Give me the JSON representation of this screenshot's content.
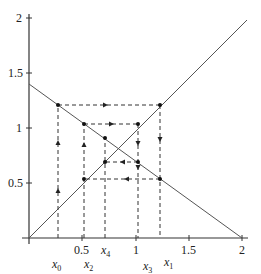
{
  "diagram": {
    "type": "cobweb-plot",
    "axes": {
      "x_ticks": [
        "0.5",
        "1",
        "1.5",
        "2"
      ],
      "y_ticks": [
        "0.5",
        "1",
        "1.5",
        "2"
      ],
      "x_range": [
        0,
        2
      ],
      "y_range": [
        0,
        2
      ]
    },
    "curves": [
      {
        "name": "identity-line",
        "equation": "y = x"
      },
      {
        "name": "decreasing-line",
        "equation": "y = 1.4 - 0.7x"
      }
    ],
    "iterates": [
      {
        "label": "x",
        "sub": "0",
        "value": 0.28
      },
      {
        "label": "x",
        "sub": "1",
        "value": 1.23
      },
      {
        "label": "x",
        "sub": "2",
        "value": 0.52
      },
      {
        "label": "x",
        "sub": "3",
        "value": 1.02
      },
      {
        "label": "x",
        "sub": "4",
        "value": 0.7
      }
    ],
    "colors": {
      "axis": "#333333",
      "curve": "#555555",
      "dashed": "#333333",
      "point": "#111111"
    }
  }
}
